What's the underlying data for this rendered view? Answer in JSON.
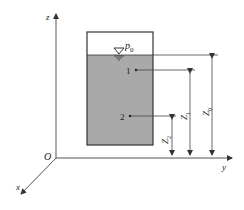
{
  "diagram": {
    "type": "hydrostatic-tank",
    "axes": {
      "z_label": "z",
      "y_label": "y",
      "x_label": "x",
      "origin_label": "O"
    },
    "surface_pressure_label": "p",
    "surface_pressure_sub": "0",
    "points": [
      {
        "label": "1"
      },
      {
        "label": "2"
      }
    ],
    "dimensions": [
      {
        "label": "Z",
        "sub": "0"
      },
      {
        "label": "Z",
        "sub": "1"
      },
      {
        "label": "Z",
        "sub": "2"
      }
    ],
    "colors": {
      "water": "#a9a9a9",
      "line": "#333333",
      "background": "#ffffff"
    }
  }
}
